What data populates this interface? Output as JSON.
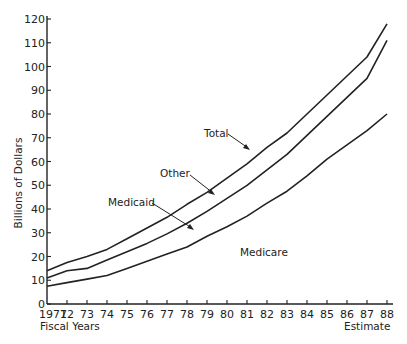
{
  "chart_data": {
    "type": "line",
    "title": "",
    "xlabel": "Fiscal Years",
    "xlabel_right": "Estimate",
    "ylabel": "Billions of Dollars",
    "ylim": [
      0,
      120
    ],
    "yticks": [
      0,
      10,
      20,
      30,
      40,
      50,
      60,
      70,
      80,
      90,
      100,
      110,
      120
    ],
    "grid": false,
    "legend": "none (inline annotations)",
    "categories": [
      "1971",
      "72",
      "73",
      "74",
      "75",
      "76",
      "77",
      "78",
      "79",
      "80",
      "81",
      "82",
      "83",
      "84",
      "85",
      "86",
      "87",
      "88"
    ],
    "series": [
      {
        "name": "Total",
        "values": [
          14,
          17.5,
          20,
          23,
          27.5,
          32,
          36.5,
          42,
          47,
          53,
          59,
          66,
          72,
          80,
          88,
          96,
          104,
          118
        ]
      },
      {
        "name": "Medicare + Medicaid (Other boundary)",
        "values": [
          11,
          14,
          15,
          18.5,
          22,
          25.5,
          29.5,
          34,
          39,
          44.5,
          50,
          56.5,
          63,
          71,
          79,
          87,
          95,
          111
        ]
      },
      {
        "name": "Medicare",
        "values": [
          7.5,
          9,
          10.5,
          12,
          15,
          18,
          21,
          24,
          28.5,
          32.5,
          37,
          42.5,
          47.5,
          54,
          61,
          67,
          73,
          80
        ]
      }
    ],
    "annotations": [
      {
        "text": "Total",
        "points_to": "Total line"
      },
      {
        "text": "Other",
        "points_to": "band between middle and top line"
      },
      {
        "text": "Medicaid",
        "points_to": "band between bottom and middle line"
      },
      {
        "text": "Medicare",
        "points_to": "area below bottom line"
      }
    ]
  }
}
